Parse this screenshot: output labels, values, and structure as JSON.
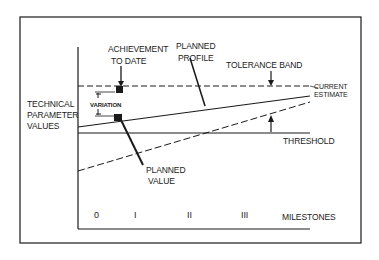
{
  "diagram": {
    "labels": {
      "achievement_line1": "ACHIEVEMENT",
      "achievement_line2": "TO DATE",
      "planned_profile_line1": "PLANNED",
      "planned_profile_line2": "PROFILE",
      "tolerance_band": "TOLERANCE BAND",
      "current_estimate_line1": "CURRENT",
      "current_estimate_line2": "ESTIMATE",
      "y_axis_line1": "TECHNICAL",
      "y_axis_line2": "PARAMETER",
      "y_axis_line3": "VALUES",
      "variation": "VARIATION",
      "planned_value_line1": "PLANNED",
      "planned_value_line2": "VALUE",
      "threshold": "THRESHOLD",
      "x_axis": "MILESTONES"
    },
    "milestones": [
      "0",
      "I",
      "II",
      "III"
    ],
    "colors": {
      "ink": "#1a1a1a",
      "background": "#ffffff"
    }
  }
}
